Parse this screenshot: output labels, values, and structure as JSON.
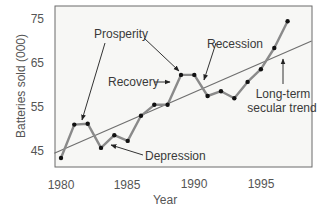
{
  "chart_data": {
    "type": "line",
    "title": "",
    "xlabel": "Year",
    "ylabel": "Batteries sold (000)",
    "xlim": [
      1979.5,
      1998.8
    ],
    "ylim": [
      41.6,
      78.2
    ],
    "grid": false,
    "legend": "none",
    "x_ticks": [
      1980,
      1985,
      1990,
      1995
    ],
    "y_ticks": [
      45,
      55,
      65,
      75
    ],
    "series": [
      {
        "name": "Batteries sold",
        "x": [
          1980,
          1981,
          1982,
          1983,
          1984,
          1985,
          1986,
          1987,
          1988,
          1989,
          1990,
          1991,
          1992,
          1993,
          1994,
          1995,
          1996,
          1997
        ],
        "values": [
          43.4,
          51.0,
          51.2,
          45.7,
          48.6,
          47.3,
          53.0,
          55.5,
          55.5,
          62.3,
          62.3,
          57.5,
          58.6,
          57.0,
          60.7,
          63.6,
          68.4,
          74.5
        ]
      },
      {
        "name": "Long-term secular trend",
        "x": [
          1979.5,
          1998.8
        ],
        "values": [
          44.5,
          70.0
        ]
      }
    ],
    "annotations": [
      {
        "text": "Prosperity",
        "arrows_to": [
          1981.5,
          1989
        ]
      },
      {
        "text": "Recovery",
        "arrows_to": [
          1988.7
        ]
      },
      {
        "text": "Recession",
        "arrows_to": [
          1990.7
        ]
      },
      {
        "text": "Depression",
        "arrows_to": [
          1983.5
        ]
      },
      {
        "text": "Long-term secular trend",
        "arrows_to": [
          1996.5
        ]
      }
    ]
  },
  "labels": {
    "ylabel": "Batteries sold (000)",
    "xlabel": "Year",
    "y_ticks": [
      "75",
      "65",
      "55",
      "45"
    ],
    "x_ticks": [
      "1980",
      "1985",
      "1990",
      "1995"
    ],
    "prosperity": "Prosperity",
    "recovery": "Recovery",
    "recession": "Recession",
    "depression": "Depression",
    "trend_line1": "Long-term",
    "trend_line2": "secular trend"
  },
  "colors": {
    "plot_bg": "#f7f7f5",
    "frame": "#6b6b6b",
    "series_line": "#8a8a8a",
    "trend_line": "#6f6f6f",
    "marker": "#111111",
    "arrow": "#333333"
  }
}
